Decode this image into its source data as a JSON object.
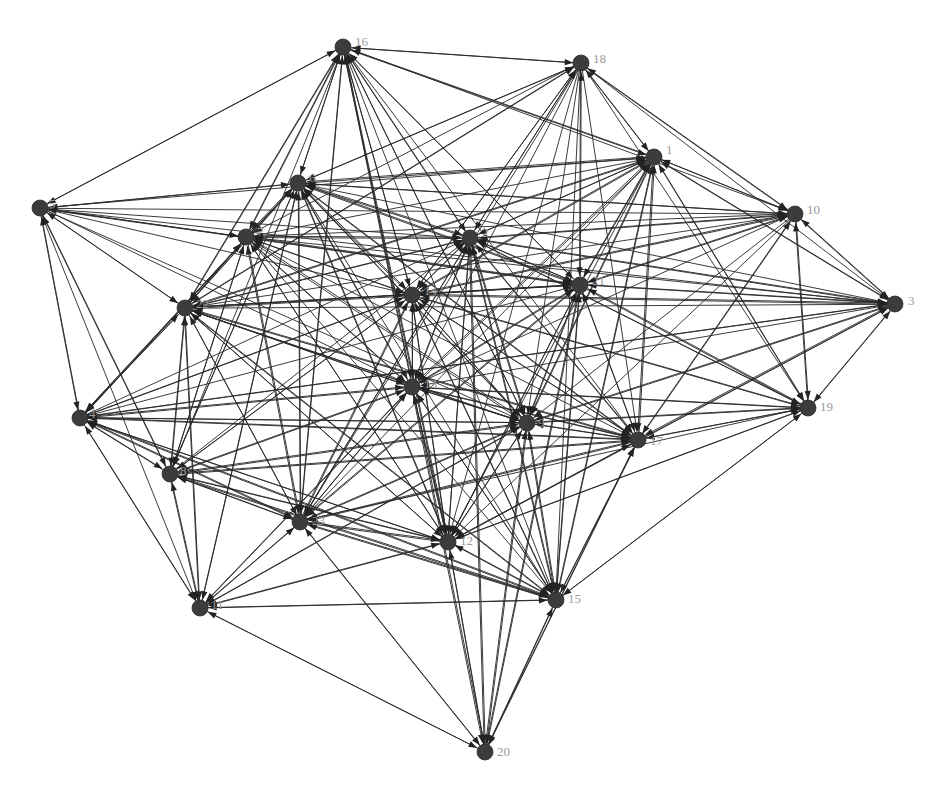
{
  "figure": {
    "title": "",
    "type": "directed-network-graph",
    "background_color": "#ffffff",
    "node_color": "#3c3c3c",
    "edge_color": "#2b2b2b",
    "label_color": "#9a9a9a",
    "arrow_color": "#232323",
    "node_radius": 8,
    "label_font_size": 13,
    "width": 950,
    "height": 803,
    "node_count": 23,
    "edge_count": 249,
    "directed": true
  },
  "chart_data": {
    "type": "network",
    "title": "",
    "xlabel": "",
    "ylabel": "",
    "grid": false,
    "legend": "none",
    "directed": true,
    "nodes": [
      {
        "id": 1,
        "label": "1",
        "x": 654,
        "y": 157,
        "label_dx": 12,
        "label_dy": -6
      },
      {
        "id": 2,
        "label": "2",
        "x": 470,
        "y": 238,
        "label_dx": 12,
        "label_dy": -4
      },
      {
        "id": 3,
        "label": "3",
        "x": 895,
        "y": 304,
        "label_dx": 13,
        "label_dy": -2
      },
      {
        "id": 4,
        "label": "4",
        "x": 80,
        "y": 418,
        "label_dx": 9,
        "label_dy": -3
      },
      {
        "id": 5,
        "label": "5",
        "x": 40,
        "y": 208,
        "label_dx": 9,
        "label_dy": -3
      },
      {
        "id": 6,
        "label": "6",
        "x": 298,
        "y": 183,
        "label_dx": 11,
        "label_dy": -4
      },
      {
        "id": 7,
        "label": "7",
        "x": 246,
        "y": 237,
        "label_dx": 11,
        "label_dy": -4
      },
      {
        "id": 8,
        "label": "8",
        "x": 170,
        "y": 474,
        "label_dx": 10,
        "label_dy": -2
      },
      {
        "id": 9,
        "label": "9",
        "x": 527,
        "y": 423,
        "label_dx": 11,
        "label_dy": 1
      },
      {
        "id": 10,
        "label": "10",
        "x": 795,
        "y": 214,
        "label_dx": 12,
        "label_dy": -3
      },
      {
        "id": 11,
        "label": "11",
        "x": 200,
        "y": 608,
        "label_dx": 11,
        "label_dy": -2
      },
      {
        "id": 12,
        "label": "12",
        "x": 448,
        "y": 542,
        "label_dx": 12,
        "label_dy": 0
      },
      {
        "id": 13,
        "label": "13",
        "x": 412,
        "y": 387,
        "label_dx": 12,
        "label_dy": -2
      },
      {
        "id": 14,
        "label": "14",
        "x": 412,
        "y": 295,
        "label_dx": 12,
        "label_dy": -3
      },
      {
        "id": 15,
        "label": "15",
        "x": 556,
        "y": 600,
        "label_dx": 12,
        "label_dy": 0
      },
      {
        "id": 16,
        "label": "16",
        "x": 343,
        "y": 47,
        "label_dx": 12,
        "label_dy": -4
      },
      {
        "id": 17,
        "label": "17",
        "x": 638,
        "y": 440,
        "label_dx": 12,
        "label_dy": 2
      },
      {
        "id": 18,
        "label": "18",
        "x": 581,
        "y": 63,
        "label_dx": 12,
        "label_dy": -3
      },
      {
        "id": 19,
        "label": "19",
        "x": 808,
        "y": 408,
        "label_dx": 12,
        "label_dy": 0
      },
      {
        "id": 20,
        "label": "20",
        "x": 485,
        "y": 752,
        "label_dx": 12,
        "label_dy": 1
      },
      {
        "id": 21,
        "label": "21",
        "x": 580,
        "y": 285,
        "label_dx": 12,
        "label_dy": -3
      },
      {
        "id": 22,
        "label": "22",
        "x": 185,
        "y": 308,
        "label_dx": 11,
        "label_dy": -3
      },
      {
        "id": 23,
        "label": "23",
        "x": 300,
        "y": 522,
        "label_dx": 12,
        "label_dy": 0
      }
    ],
    "edges": [
      [
        5,
        16
      ],
      [
        5,
        6
      ],
      [
        5,
        7
      ],
      [
        5,
        22
      ],
      [
        5,
        4
      ],
      [
        5,
        2
      ],
      [
        5,
        1
      ],
      [
        5,
        10
      ],
      [
        5,
        3
      ],
      [
        5,
        14
      ],
      [
        5,
        13
      ],
      [
        5,
        21
      ],
      [
        5,
        8
      ],
      [
        5,
        9
      ],
      [
        5,
        11
      ],
      [
        16,
        5
      ],
      [
        16,
        6
      ],
      [
        16,
        7
      ],
      [
        16,
        22
      ],
      [
        16,
        2
      ],
      [
        16,
        14
      ],
      [
        16,
        13
      ],
      [
        16,
        9
      ],
      [
        16,
        12
      ],
      [
        16,
        23
      ],
      [
        16,
        21
      ],
      [
        16,
        17
      ],
      [
        16,
        1
      ],
      [
        16,
        18
      ],
      [
        16,
        10
      ],
      [
        16,
        8
      ],
      [
        16,
        15
      ],
      [
        18,
        16
      ],
      [
        18,
        1
      ],
      [
        18,
        2
      ],
      [
        18,
        6
      ],
      [
        18,
        14
      ],
      [
        18,
        13
      ],
      [
        18,
        21
      ],
      [
        18,
        9
      ],
      [
        18,
        12
      ],
      [
        18,
        23
      ],
      [
        18,
        22
      ],
      [
        18,
        7
      ],
      [
        18,
        10
      ],
      [
        18,
        17
      ],
      [
        18,
        3
      ],
      [
        18,
        15
      ],
      [
        18,
        19
      ],
      [
        1,
        18
      ],
      [
        1,
        16
      ],
      [
        1,
        2
      ],
      [
        1,
        21
      ],
      [
        1,
        10
      ],
      [
        1,
        3
      ],
      [
        1,
        14
      ],
      [
        1,
        13
      ],
      [
        1,
        9
      ],
      [
        1,
        17
      ],
      [
        1,
        12
      ],
      [
        1,
        6
      ],
      [
        1,
        22
      ],
      [
        1,
        19
      ],
      [
        1,
        15
      ],
      [
        1,
        23
      ],
      [
        10,
        1
      ],
      [
        10,
        3
      ],
      [
        10,
        2
      ],
      [
        10,
        21
      ],
      [
        10,
        14
      ],
      [
        10,
        13
      ],
      [
        10,
        9
      ],
      [
        10,
        17
      ],
      [
        10,
        19
      ],
      [
        10,
        6
      ],
      [
        10,
        22
      ],
      [
        10,
        12
      ],
      [
        10,
        18
      ],
      [
        10,
        7
      ],
      [
        3,
        10
      ],
      [
        3,
        1
      ],
      [
        3,
        21
      ],
      [
        3,
        2
      ],
      [
        3,
        14
      ],
      [
        3,
        13
      ],
      [
        3,
        9
      ],
      [
        3,
        17
      ],
      [
        3,
        19
      ],
      [
        3,
        6
      ],
      [
        3,
        22
      ],
      [
        3,
        12
      ],
      [
        3,
        7
      ],
      [
        3,
        4
      ],
      [
        6,
        5
      ],
      [
        6,
        16
      ],
      [
        6,
        7
      ],
      [
        6,
        22
      ],
      [
        6,
        2
      ],
      [
        6,
        14
      ],
      [
        6,
        13
      ],
      [
        6,
        1
      ],
      [
        6,
        21
      ],
      [
        6,
        9
      ],
      [
        6,
        12
      ],
      [
        6,
        23
      ],
      [
        6,
        8
      ],
      [
        6,
        4
      ],
      [
        6,
        18
      ],
      [
        6,
        17
      ],
      [
        6,
        10
      ],
      [
        6,
        15
      ],
      [
        6,
        11
      ],
      [
        7,
        5
      ],
      [
        7,
        6
      ],
      [
        7,
        16
      ],
      [
        7,
        22
      ],
      [
        7,
        2
      ],
      [
        7,
        14
      ],
      [
        7,
        13
      ],
      [
        7,
        9
      ],
      [
        7,
        12
      ],
      [
        7,
        23
      ],
      [
        7,
        8
      ],
      [
        7,
        4
      ],
      [
        7,
        21
      ],
      [
        7,
        17
      ],
      [
        7,
        1
      ],
      [
        7,
        15
      ],
      [
        22,
        5
      ],
      [
        22,
        6
      ],
      [
        22,
        7
      ],
      [
        22,
        16
      ],
      [
        22,
        4
      ],
      [
        22,
        8
      ],
      [
        22,
        2
      ],
      [
        22,
        14
      ],
      [
        22,
        13
      ],
      [
        22,
        9
      ],
      [
        22,
        12
      ],
      [
        22,
        23
      ],
      [
        22,
        21
      ],
      [
        22,
        1
      ],
      [
        22,
        17
      ],
      [
        22,
        11
      ],
      [
        22,
        15
      ],
      [
        22,
        18
      ],
      [
        2,
        6
      ],
      [
        2,
        7
      ],
      [
        2,
        14
      ],
      [
        2,
        13
      ],
      [
        2,
        21
      ],
      [
        2,
        1
      ],
      [
        2,
        9
      ],
      [
        2,
        12
      ],
      [
        2,
        23
      ],
      [
        2,
        22
      ],
      [
        2,
        16
      ],
      [
        2,
        18
      ],
      [
        2,
        10
      ],
      [
        2,
        3
      ],
      [
        2,
        17
      ],
      [
        2,
        15
      ],
      [
        2,
        19
      ],
      [
        2,
        20
      ],
      [
        14,
        2
      ],
      [
        14,
        6
      ],
      [
        14,
        7
      ],
      [
        14,
        13
      ],
      [
        14,
        21
      ],
      [
        14,
        9
      ],
      [
        14,
        12
      ],
      [
        14,
        23
      ],
      [
        14,
        22
      ],
      [
        14,
        16
      ],
      [
        14,
        1
      ],
      [
        14,
        18
      ],
      [
        14,
        10
      ],
      [
        14,
        3
      ],
      [
        14,
        17
      ],
      [
        14,
        15
      ],
      [
        14,
        8
      ],
      [
        14,
        4
      ],
      [
        14,
        19
      ],
      [
        21,
        2
      ],
      [
        21,
        14
      ],
      [
        21,
        13
      ],
      [
        21,
        9
      ],
      [
        21,
        1
      ],
      [
        21,
        17
      ],
      [
        21,
        12
      ],
      [
        21,
        23
      ],
      [
        21,
        22
      ],
      [
        21,
        16
      ],
      [
        21,
        18
      ],
      [
        21,
        10
      ],
      [
        21,
        3
      ],
      [
        21,
        19
      ],
      [
        21,
        15
      ],
      [
        21,
        6
      ],
      [
        21,
        7
      ],
      [
        21,
        20
      ],
      [
        13,
        14
      ],
      [
        13,
        2
      ],
      [
        13,
        6
      ],
      [
        13,
        7
      ],
      [
        13,
        9
      ],
      [
        13,
        12
      ],
      [
        13,
        23
      ],
      [
        13,
        22
      ],
      [
        13,
        21
      ],
      [
        13,
        17
      ],
      [
        13,
        8
      ],
      [
        13,
        4
      ],
      [
        13,
        15
      ],
      [
        13,
        16
      ],
      [
        13,
        1
      ],
      [
        13,
        11
      ],
      [
        13,
        20
      ],
      [
        13,
        19
      ],
      [
        9,
        13
      ],
      [
        9,
        14
      ],
      [
        9,
        2
      ],
      [
        9,
        21
      ],
      [
        9,
        12
      ],
      [
        9,
        23
      ],
      [
        9,
        17
      ],
      [
        9,
        22
      ],
      [
        9,
        15
      ],
      [
        9,
        8
      ],
      [
        9,
        4
      ],
      [
        9,
        6
      ],
      [
        9,
        7
      ],
      [
        9,
        1
      ],
      [
        9,
        16
      ],
      [
        9,
        19
      ],
      [
        9,
        3
      ],
      [
        9,
        20
      ],
      [
        9,
        11
      ],
      [
        17,
        9
      ],
      [
        17,
        21
      ],
      [
        17,
        13
      ],
      [
        17,
        12
      ],
      [
        17,
        23
      ],
      [
        17,
        15
      ],
      [
        17,
        19
      ],
      [
        17,
        14
      ],
      [
        17,
        2
      ],
      [
        17,
        1
      ],
      [
        17,
        22
      ],
      [
        17,
        8
      ],
      [
        17,
        4
      ],
      [
        17,
        6
      ],
      [
        17,
        20
      ],
      [
        17,
        3
      ],
      [
        17,
        10
      ],
      [
        19,
        17
      ],
      [
        19,
        9
      ],
      [
        19,
        21
      ],
      [
        19,
        15
      ],
      [
        19,
        3
      ],
      [
        19,
        10
      ],
      [
        19,
        1
      ],
      [
        19,
        13
      ],
      [
        19,
        12
      ],
      [
        19,
        14
      ],
      [
        19,
        2
      ],
      [
        19,
        23
      ],
      [
        4,
        5
      ],
      [
        4,
        22
      ],
      [
        4,
        8
      ],
      [
        4,
        7
      ],
      [
        4,
        6
      ],
      [
        4,
        13
      ],
      [
        4,
        14
      ],
      [
        4,
        9
      ],
      [
        4,
        23
      ],
      [
        4,
        12
      ],
      [
        4,
        11
      ],
      [
        4,
        2
      ],
      [
        4,
        21
      ],
      [
        4,
        17
      ],
      [
        4,
        15
      ],
      [
        4,
        3
      ],
      [
        8,
        4
      ],
      [
        8,
        22
      ],
      [
        8,
        23
      ],
      [
        8,
        12
      ],
      [
        8,
        13
      ],
      [
        8,
        9
      ],
      [
        8,
        11
      ],
      [
        8,
        15
      ],
      [
        8,
        7
      ],
      [
        8,
        6
      ],
      [
        8,
        14
      ],
      [
        8,
        17
      ],
      [
        8,
        2
      ],
      [
        8,
        5
      ],
      [
        23,
        8
      ],
      [
        23,
        12
      ],
      [
        23,
        13
      ],
      [
        23,
        9
      ],
      [
        23,
        11
      ],
      [
        23,
        15
      ],
      [
        23,
        22
      ],
      [
        23,
        4
      ],
      [
        23,
        14
      ],
      [
        23,
        2
      ],
      [
        23,
        17
      ],
      [
        23,
        21
      ],
      [
        23,
        6
      ],
      [
        23,
        7
      ],
      [
        23,
        20
      ],
      [
        23,
        16
      ],
      [
        12,
        23
      ],
      [
        12,
        13
      ],
      [
        12,
        9
      ],
      [
        12,
        15
      ],
      [
        12,
        11
      ],
      [
        12,
        8
      ],
      [
        12,
        22
      ],
      [
        12,
        14
      ],
      [
        12,
        2
      ],
      [
        12,
        17
      ],
      [
        12,
        21
      ],
      [
        12,
        20
      ],
      [
        12,
        4
      ],
      [
        12,
        6
      ],
      [
        12,
        7
      ],
      [
        12,
        16
      ],
      [
        12,
        19
      ],
      [
        15,
        12
      ],
      [
        15,
        9
      ],
      [
        15,
        17
      ],
      [
        15,
        23
      ],
      [
        15,
        13
      ],
      [
        15,
        11
      ],
      [
        15,
        8
      ],
      [
        15,
        20
      ],
      [
        15,
        19
      ],
      [
        15,
        21
      ],
      [
        15,
        14
      ],
      [
        15,
        2
      ],
      [
        15,
        22
      ],
      [
        15,
        4
      ],
      [
        15,
        1
      ],
      [
        11,
        4
      ],
      [
        11,
        8
      ],
      [
        11,
        23
      ],
      [
        11,
        22
      ],
      [
        11,
        13
      ],
      [
        11,
        12
      ],
      [
        11,
        9
      ],
      [
        11,
        20
      ],
      [
        11,
        15
      ],
      [
        11,
        6
      ],
      [
        20,
        12
      ],
      [
        20,
        15
      ],
      [
        20,
        23
      ],
      [
        20,
        9
      ],
      [
        20,
        17
      ],
      [
        20,
        11
      ],
      [
        20,
        13
      ],
      [
        20,
        21
      ],
      [
        20,
        2
      ]
    ]
  }
}
